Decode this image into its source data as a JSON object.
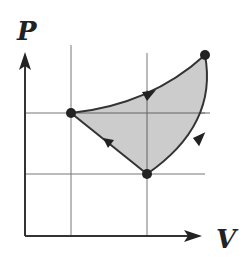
{
  "diagram": {
    "type": "pv-cycle",
    "axes": {
      "y_label": "P",
      "x_label": "V"
    },
    "colors": {
      "fill": "#c9c9c9",
      "line": "#333333",
      "grid": "#777777",
      "point": "#222222"
    },
    "points": [
      {
        "id": "left",
        "x": 71,
        "y": 113
      },
      {
        "id": "bottom",
        "x": 147,
        "y": 174
      },
      {
        "id": "top-right",
        "x": 205,
        "y": 55
      }
    ],
    "process_direction": "clockwise: left -> top-right (curved up) -> bottom (curved down) -> left (straight)"
  }
}
